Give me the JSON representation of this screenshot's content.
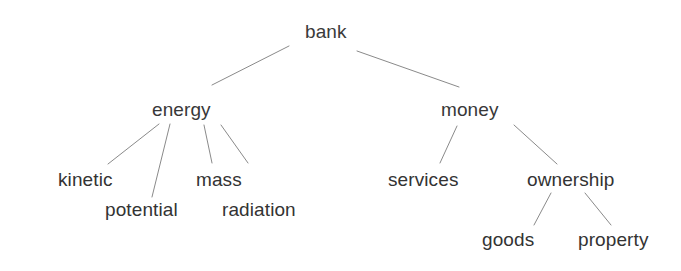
{
  "figure": {
    "background_color": "#ffffff",
    "text_color": "#353535",
    "edge_color": "#8a8a8a",
    "edge_width": 1
  },
  "nodes": [
    {
      "id": "bank",
      "label": "bank",
      "level": 0,
      "x": 305,
      "y": 22
    },
    {
      "id": "energy",
      "label": "energy",
      "level": 1,
      "x": 152,
      "y": 100
    },
    {
      "id": "money",
      "label": "money",
      "level": 1,
      "x": 441,
      "y": 100
    },
    {
      "id": "kinetic",
      "label": "kinetic",
      "level": 2,
      "x": 58,
      "y": 170
    },
    {
      "id": "potential",
      "label": "potential",
      "level": 2,
      "x": 105,
      "y": 200
    },
    {
      "id": "mass",
      "label": "mass",
      "level": 2,
      "x": 196,
      "y": 170
    },
    {
      "id": "radiation",
      "label": "radiation",
      "level": 2,
      "x": 222,
      "y": 200
    },
    {
      "id": "services",
      "label": "services",
      "level": 2,
      "x": 388,
      "y": 170
    },
    {
      "id": "ownership",
      "label": "ownership",
      "level": 2,
      "x": 527,
      "y": 170
    },
    {
      "id": "goods",
      "label": "goods",
      "level": 3,
      "x": 482,
      "y": 230
    },
    {
      "id": "property",
      "label": "property",
      "level": 3,
      "x": 578,
      "y": 230
    }
  ],
  "edges": [
    {
      "from": "bank",
      "to": "energy",
      "x1": 289,
      "y1": 46,
      "x2": 212,
      "y2": 85
    },
    {
      "from": "bank",
      "to": "money",
      "x1": 357,
      "y1": 51,
      "x2": 459,
      "y2": 87
    },
    {
      "from": "energy",
      "to": "kinetic",
      "x1": 159,
      "y1": 124,
      "x2": 108,
      "y2": 164
    },
    {
      "from": "energy",
      "to": "potential",
      "x1": 170,
      "y1": 124,
      "x2": 152,
      "y2": 197
    },
    {
      "from": "energy",
      "to": "mass",
      "x1": 204,
      "y1": 125,
      "x2": 212,
      "y2": 163
    },
    {
      "from": "energy",
      "to": "radiation",
      "x1": 221,
      "y1": 125,
      "x2": 248,
      "y2": 163
    },
    {
      "from": "money",
      "to": "services",
      "x1": 457,
      "y1": 126,
      "x2": 440,
      "y2": 163
    },
    {
      "from": "money",
      "to": "ownership",
      "x1": 514,
      "y1": 125,
      "x2": 557,
      "y2": 164
    },
    {
      "from": "ownership",
      "to": "goods",
      "x1": 551,
      "y1": 193,
      "x2": 534,
      "y2": 225
    },
    {
      "from": "ownership",
      "to": "property",
      "x1": 585,
      "y1": 193,
      "x2": 611,
      "y2": 225
    }
  ]
}
